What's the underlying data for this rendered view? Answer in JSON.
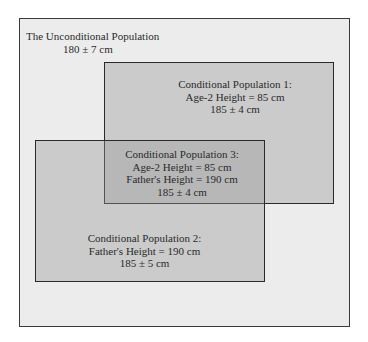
{
  "diagram": {
    "outer": {
      "title": "The Unconditional Population",
      "value": "180 ± 7 cm"
    },
    "populations": [
      {
        "title": "Conditional Population 1:",
        "condition": "Age-2 Height = 85 cm",
        "value": "185 ± 4 cm"
      },
      {
        "title": "Conditional Population 2:",
        "condition": "Father's Height = 190 cm",
        "value": "185 ± 5 cm"
      },
      {
        "title": "Conditional Population 3:",
        "condition1": "Age-2 Height = 85 cm",
        "condition2": "Father's Height = 190 cm",
        "value": "185 ± 4 cm"
      }
    ],
    "colors": {
      "outer_fill": "#ececec",
      "box_fill": "#d4d4d4",
      "overlap_fill": "#bdbdbd",
      "border": "#2a2a2a"
    }
  }
}
